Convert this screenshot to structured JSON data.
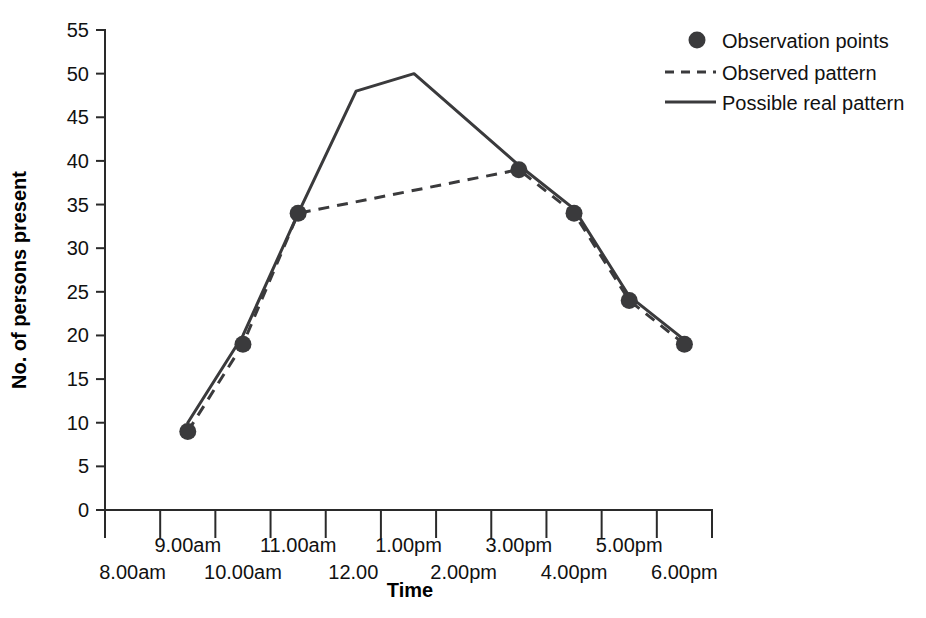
{
  "chart_data": {
    "type": "line",
    "title": "",
    "xlabel": "Time",
    "ylabel": "No. of persons present",
    "xlim": [
      0,
      11
    ],
    "ylim": [
      0,
      55
    ],
    "ytick_values": [
      0,
      5,
      10,
      15,
      20,
      25,
      30,
      35,
      40,
      45,
      50,
      55
    ],
    "ytick_labels": [
      "0",
      "5",
      "10",
      "15",
      "20",
      "25",
      "30",
      "35",
      "40",
      "45",
      "50",
      "55"
    ],
    "xtick_labels_upper": [
      "9.00am",
      "11.00am",
      "1.00pm",
      "3.00pm",
      "5.00pm"
    ],
    "xtick_labels_lower": [
      "8.00am",
      "10.00am",
      "12.00",
      "2.00pm",
      "4.00pm",
      "6.00pm"
    ],
    "xtick_labels_all": [
      "8.00am",
      "9.00am",
      "10.00am",
      "11.00am",
      "12.00",
      "1.00pm",
      "2.00pm",
      "3.00pm",
      "4.00pm",
      "5.00pm",
      "6.00pm"
    ],
    "grid": false,
    "legend_position": "top-right",
    "series": [
      {
        "name": "Observation points",
        "style": "marker",
        "x": [
          "9.00am",
          "10.00am",
          "11.00am",
          "3.00pm",
          "4.00pm",
          "5.00pm",
          "6.00pm"
        ],
        "x_index": [
          1.5,
          2.5,
          3.5,
          7.5,
          8.5,
          9.5,
          10.5
        ],
        "values": [
          9,
          19,
          34,
          39,
          34,
          24,
          19
        ]
      },
      {
        "name": "Observed pattern",
        "style": "dashed",
        "x": [
          "9.00am",
          "10.00am",
          "11.00am",
          "3.00pm",
          "4.00pm",
          "5.00pm",
          "6.00pm"
        ],
        "x_index": [
          1.5,
          2.5,
          3.5,
          7.5,
          8.5,
          9.5,
          10.5
        ],
        "values": [
          9,
          19,
          34,
          39,
          34,
          24,
          19
        ]
      },
      {
        "name": "Possible real pattern",
        "style": "solid",
        "x": [
          "9.00am",
          "10.00am",
          "11.00am",
          "12.00",
          "1.00pm",
          "3.00pm",
          "4.00pm",
          "5.00pm",
          "6.00pm"
        ],
        "x_index": [
          1.5,
          2.5,
          3.5,
          4.55,
          5.6,
          7.5,
          8.5,
          9.5,
          10.5
        ],
        "values": [
          10,
          20,
          34,
          48,
          50,
          39.5,
          34.5,
          24.5,
          19.5
        ]
      }
    ],
    "legend": [
      {
        "label": "Observation points",
        "marker": "dot"
      },
      {
        "label": "Observed pattern",
        "marker": "dashed-line"
      },
      {
        "label": "Possible real pattern",
        "marker": "solid-line"
      }
    ]
  },
  "axes": {
    "y_title": "No. of persons present",
    "x_title": "Time"
  }
}
